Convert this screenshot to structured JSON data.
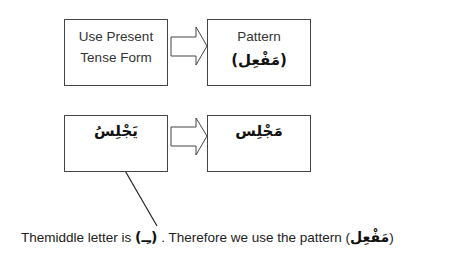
{
  "row1": {
    "left_box": {
      "line1": "Use Present",
      "line2": "Tense Form"
    },
    "right_box": {
      "line1": "Pattern",
      "line2": "(مَفْعِل)"
    }
  },
  "row2": {
    "left_box": {
      "word": "يَجْلِسُ"
    },
    "right_box": {
      "word": "مَجْلِس"
    }
  },
  "caption": {
    "part1": "Themiddle letter is ",
    "letter": "(ـِـ)",
    "part2": " .  Therefore we use the pattern (",
    "pattern": "مَفْعِل",
    "part3": ")"
  }
}
